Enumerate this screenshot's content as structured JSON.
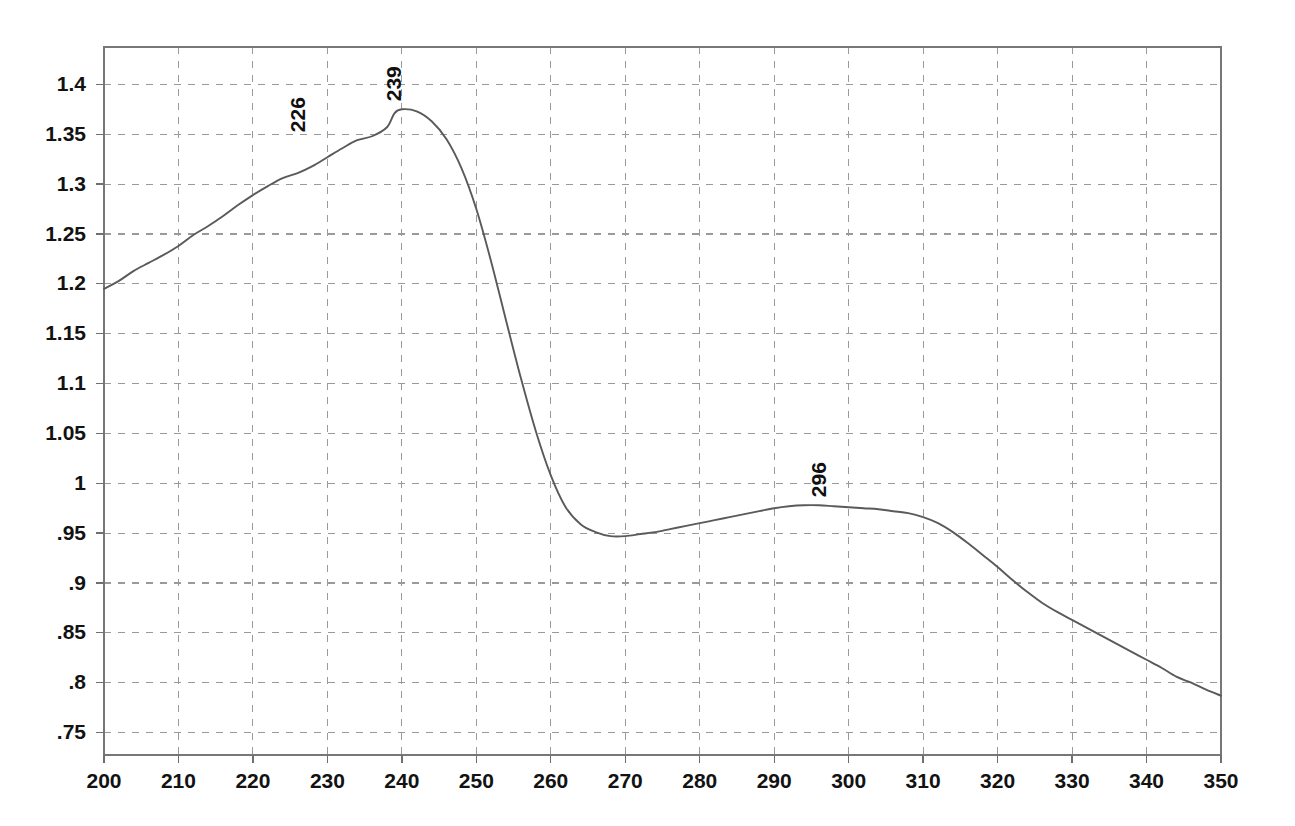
{
  "chart_data": {
    "type": "line",
    "title": "",
    "subtitle": "",
    "xlabel": "",
    "ylabel": "",
    "xlim": [
      200,
      350
    ],
    "ylim": [
      0.7275,
      1.4375
    ],
    "grid": true,
    "legend": "none",
    "line_color": "#5a5a5a",
    "grid_color": "#9a9a9a",
    "axis_color": "#777777",
    "background_color": "#ffffff",
    "x_ticks": [
      200,
      210,
      220,
      230,
      240,
      250,
      260,
      270,
      280,
      290,
      300,
      310,
      320,
      330,
      340,
      350
    ],
    "x_tick_labels": [
      "200",
      "210",
      "220",
      "230",
      "240",
      "250",
      "260",
      "270",
      "280",
      "290",
      "300",
      "310",
      "320",
      "330",
      "340",
      "350"
    ],
    "y_ticks": [
      0.75,
      0.8,
      0.85,
      0.9,
      0.95,
      1.0,
      1.05,
      1.1,
      1.15,
      1.2,
      1.25,
      1.3,
      1.35,
      1.4
    ],
    "y_tick_labels": [
      ".75",
      ".8",
      ".85",
      ".9",
      ".95",
      "1",
      "1.05",
      "1.1",
      "1.15",
      "1.2",
      "1.25",
      "1.3",
      "1.35",
      "1.4"
    ],
    "annotations": [
      {
        "label": "226",
        "x": 226,
        "y": 1.344,
        "rotation": -90
      },
      {
        "label": "239",
        "x": 239,
        "y": 1.375,
        "rotation": -90
      },
      {
        "label": "296",
        "x": 296,
        "y": 0.978,
        "rotation": -90
      }
    ],
    "series": [
      {
        "name": "absorbance",
        "x": [
          200,
          202,
          204,
          206,
          208,
          210,
          212,
          214,
          216,
          218,
          220,
          222,
          224,
          226,
          228,
          230,
          232,
          234,
          236,
          238,
          239,
          240,
          242,
          244,
          246,
          248,
          250,
          252,
          254,
          256,
          258,
          260,
          262,
          264,
          266,
          268,
          270,
          272,
          274,
          276,
          278,
          280,
          282,
          284,
          286,
          288,
          290,
          292,
          294,
          296,
          298,
          300,
          302,
          304,
          306,
          308,
          310,
          312,
          314,
          316,
          318,
          320,
          322,
          324,
          326,
          328,
          330,
          332,
          334,
          336,
          338,
          340,
          342,
          344,
          346,
          348,
          350
        ],
        "y": [
          1.195,
          1.203,
          1.213,
          1.221,
          1.229,
          1.238,
          1.249,
          1.258,
          1.268,
          1.279,
          1.289,
          1.298,
          1.306,
          1.311,
          1.318,
          1.327,
          1.336,
          1.344,
          1.348,
          1.357,
          1.371,
          1.375,
          1.373,
          1.363,
          1.345,
          1.316,
          1.275,
          1.222,
          1.163,
          1.105,
          1.052,
          1.008,
          0.976,
          0.959,
          0.951,
          0.947,
          0.947,
          0.949,
          0.951,
          0.954,
          0.957,
          0.96,
          0.963,
          0.966,
          0.969,
          0.972,
          0.975,
          0.977,
          0.978,
          0.978,
          0.977,
          0.976,
          0.975,
          0.974,
          0.972,
          0.97,
          0.966,
          0.96,
          0.951,
          0.94,
          0.928,
          0.916,
          0.903,
          0.891,
          0.88,
          0.871,
          0.863,
          0.855,
          0.847,
          0.839,
          0.831,
          0.823,
          0.815,
          0.806,
          0.8,
          0.793,
          0.787
        ]
      }
    ]
  }
}
